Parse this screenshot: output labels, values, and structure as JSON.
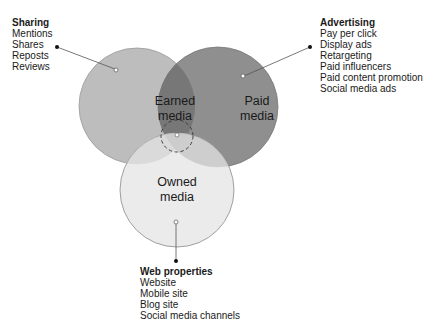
{
  "diagram": {
    "type": "venn",
    "circles": [
      {
        "id": "earned",
        "label_line1": "Earned",
        "label_line2": "media",
        "color": "#bdbdbd"
      },
      {
        "id": "paid",
        "label_line1": "Paid",
        "label_line2": "media",
        "color": "#8e8e8e"
      },
      {
        "id": "owned",
        "label_line1": "Owned",
        "label_line2": "media",
        "color": "#e6e6e6"
      }
    ],
    "callouts": {
      "earned": {
        "title": "Sharing",
        "items": [
          "Mentions",
          "Shares",
          "Reposts",
          "Reviews"
        ]
      },
      "paid": {
        "title": "Advertising",
        "items": [
          "Pay per click",
          "Display ads",
          "Retargeting",
          "Paid influencers",
          "Paid content promotion",
          "Social media ads"
        ]
      },
      "owned": {
        "title": "Web properties",
        "items": [
          "Website",
          "Mobile site",
          "Blog site",
          "Social media channels"
        ]
      }
    }
  }
}
